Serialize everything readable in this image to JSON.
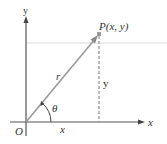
{
  "diagram": {
    "labels": {
      "y_axis": "y",
      "x_axis": "x",
      "origin": "O",
      "point": "P(x, y)",
      "radius": "r",
      "angle": "θ",
      "x_segment": "x",
      "y_segment": "y"
    },
    "colors": {
      "axis": "#555555",
      "ray": "#9a9a9a",
      "point": "#999999",
      "dashed": "#777777",
      "guide_line": "#d8d8d8",
      "text": "#333333"
    }
  }
}
